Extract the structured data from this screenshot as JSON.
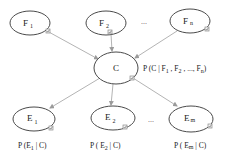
{
  "diagram": {
    "type": "bayesian-network",
    "nodes": {
      "features": [
        {
          "id": "F1",
          "letter": "F",
          "sub": "1"
        },
        {
          "id": "F2",
          "letter": "F",
          "sub": "2"
        },
        {
          "id": "Fn",
          "letter": "F",
          "sub": "n"
        }
      ],
      "class": {
        "id": "C",
        "letter": "C"
      },
      "effects": [
        {
          "id": "E1",
          "letter": "E",
          "sub": "1"
        },
        {
          "id": "E2",
          "letter": "E",
          "sub": "2"
        },
        {
          "id": "Em",
          "letter": "E",
          "sub": "m"
        }
      ]
    },
    "ellipsis": "...",
    "edges": [
      {
        "from": "F1",
        "to": "C"
      },
      {
        "from": "F2",
        "to": "C"
      },
      {
        "from": "Fn",
        "to": "C"
      },
      {
        "from": "C",
        "to": "E1"
      },
      {
        "from": "C",
        "to": "E2"
      },
      {
        "from": "C",
        "to": "Em"
      }
    ],
    "labels": {
      "class_prob": {
        "prefix": "P (C | F",
        "s1": "1",
        "mid1": " , F",
        "s2": "2",
        "mid2": " , ..., F",
        "s3": "n",
        "suffix": ")"
      },
      "e1_prob": {
        "prefix": "P (E",
        "sub": "1",
        "suffix": " | C)"
      },
      "e2_prob": {
        "prefix": "P ( E",
        "sub": "2",
        "suffix": " | C)"
      },
      "em_prob": {
        "prefix": "P ( E",
        "sub": "m",
        "suffix": " | C)"
      }
    },
    "icons": {
      "node_corner": "checkbox-icon"
    }
  }
}
